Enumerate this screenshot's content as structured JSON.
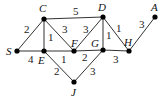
{
  "nodes": [
    {
      "id": "S",
      "x": 17,
      "y": 51,
      "lx": 6,
      "ly": 55
    },
    {
      "id": "C",
      "x": 44,
      "y": 19,
      "lx": 39,
      "ly": 12
    },
    {
      "id": "E",
      "x": 44,
      "y": 51,
      "lx": 38,
      "ly": 64
    },
    {
      "id": "F",
      "x": 74,
      "y": 51,
      "lx": 71,
      "ly": 47
    },
    {
      "id": "D",
      "x": 103,
      "y": 17,
      "lx": 98,
      "ly": 11
    },
    {
      "id": "G",
      "x": 103,
      "y": 50,
      "lx": 91,
      "ly": 47
    },
    {
      "id": "H",
      "x": 129,
      "y": 51,
      "lx": 124,
      "ly": 46
    },
    {
      "id": "A",
      "x": 155,
      "y": 17,
      "lx": 151,
      "ly": 11
    },
    {
      "id": "J",
      "x": 74,
      "y": 82,
      "lx": 71,
      "ly": 96
    }
  ],
  "edges": [
    {
      "from": "S",
      "to": "C",
      "w": "2",
      "lx": 24,
      "ly": 33
    },
    {
      "from": "S",
      "to": "E",
      "w": "4",
      "lx": 28,
      "ly": 63
    },
    {
      "from": "C",
      "to": "E",
      "w": "1",
      "lx": 48,
      "ly": 41
    },
    {
      "from": "C",
      "to": "F",
      "w": "3",
      "lx": 62,
      "ly": 33
    },
    {
      "from": "C",
      "to": "D",
      "w": "5",
      "lx": 73,
      "ly": 15
    },
    {
      "from": "E",
      "to": "F",
      "w": "1",
      "lx": 61,
      "ly": 63
    },
    {
      "from": "F",
      "to": "D",
      "w": "3",
      "lx": 83,
      "ly": 33
    },
    {
      "from": "F",
      "to": "G",
      "w": "2",
      "lx": 82,
      "ly": 61
    },
    {
      "from": "D",
      "to": "G",
      "w": "1",
      "lx": 106,
      "ly": 39
    },
    {
      "from": "D",
      "to": "H",
      "w": "1",
      "lx": 116,
      "ly": 32
    },
    {
      "from": "G",
      "to": "H",
      "w": "3",
      "lx": 113,
      "ly": 63
    },
    {
      "from": "H",
      "to": "A",
      "w": "3",
      "lx": 139,
      "ly": 28
    },
    {
      "from": "E",
      "to": "J",
      "w": "2",
      "lx": 54,
      "ly": 75
    },
    {
      "from": "G",
      "to": "J",
      "w": "3",
      "lx": 90,
      "ly": 75
    }
  ]
}
